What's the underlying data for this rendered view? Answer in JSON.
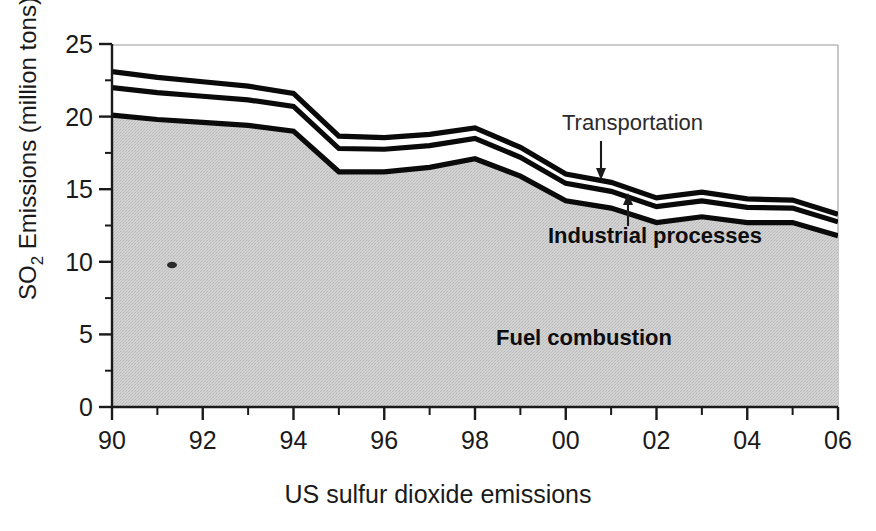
{
  "figure": {
    "caption": "US sulfur dioxide emissions"
  },
  "axes": {
    "y_title": "SO",
    "y_title_sub": "2",
    "y_title_rest": " Emissions (million tons)",
    "y_title_full": "SO2 Emissions (million tons)",
    "y_ticks": [
      "0",
      "5",
      "10",
      "15",
      "20",
      "25"
    ],
    "x_ticks": [
      "90",
      "92",
      "94",
      "96",
      "98",
      "00",
      "02",
      "04",
      "06"
    ]
  },
  "annotations": {
    "transportation": "Transportation",
    "industrial": "Industrial processes",
    "fuel": "Fuel combustion"
  },
  "colors": {
    "fill_gray": "#cfcfcf",
    "line_black": "#0a0a0a",
    "text": "#1a1a1a",
    "background": "#ffffff"
  },
  "chart_data": {
    "type": "area",
    "title": "",
    "subtitle": "",
    "xlabel": "US sulfur dioxide emissions",
    "ylabel": "SO2 Emissions (million tons)",
    "xlim": [
      1990,
      2006
    ],
    "ylim": [
      0,
      25
    ],
    "grid": false,
    "legend_position": "inline-annotations",
    "stacked": true,
    "x": [
      1990,
      1991,
      1992,
      1993,
      1994,
      1995,
      1996,
      1997,
      1998,
      1999,
      2000,
      2001,
      2002,
      2003,
      2004,
      2005,
      2006
    ],
    "x_tick_labels": [
      "90",
      "92",
      "94",
      "96",
      "98",
      "00",
      "02",
      "04",
      "06"
    ],
    "x_tick_values": [
      1990,
      1992,
      1994,
      1996,
      1998,
      2000,
      2002,
      2004,
      2006
    ],
    "y_tick_values": [
      0,
      5,
      10,
      15,
      20,
      25
    ],
    "series": [
      {
        "name": "Fuel combustion",
        "order": 1,
        "values": [
          20.1,
          19.8,
          19.6,
          19.4,
          19.0,
          16.2,
          16.2,
          16.5,
          17.1,
          15.9,
          14.2,
          13.7,
          12.7,
          13.1,
          12.7,
          12.7,
          11.8
        ]
      },
      {
        "name": "Industrial processes",
        "order": 2,
        "values": [
          1.9,
          1.85,
          1.8,
          1.75,
          1.7,
          1.6,
          1.55,
          1.5,
          1.4,
          1.3,
          1.2,
          1.15,
          1.1,
          1.1,
          1.05,
          1.0,
          0.95
        ]
      },
      {
        "name": "Transportation",
        "order": 3,
        "values": [
          1.1,
          1.05,
          1.0,
          0.95,
          0.9,
          0.85,
          0.8,
          0.78,
          0.72,
          0.68,
          0.65,
          0.62,
          0.6,
          0.6,
          0.58,
          0.55,
          0.52
        ]
      }
    ],
    "cumulative_top_fuel": [
      20.1,
      19.8,
      19.6,
      19.4,
      19.0,
      16.2,
      16.2,
      16.5,
      17.1,
      15.9,
      14.2,
      13.7,
      12.7,
      13.1,
      12.7,
      12.7,
      11.8
    ],
    "cumulative_top_industrial": [
      22.0,
      21.65,
      21.4,
      21.15,
      20.7,
      17.8,
      17.75,
      18.0,
      18.5,
      17.2,
      15.4,
      14.85,
      13.8,
      14.2,
      13.75,
      13.7,
      12.75
    ],
    "cumulative_top_transport": [
      23.1,
      22.7,
      22.4,
      22.1,
      21.6,
      18.65,
      18.55,
      18.78,
      19.22,
      17.88,
      16.05,
      15.47,
      14.4,
      14.8,
      14.33,
      14.25,
      13.27
    ]
  }
}
